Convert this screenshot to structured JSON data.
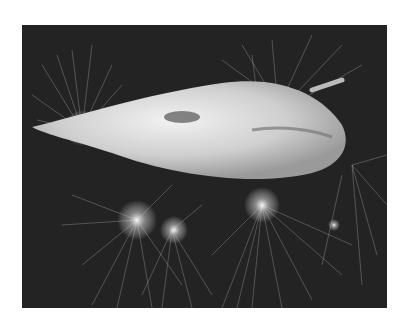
{
  "image": {
    "subject": "milkweed seed pod with silky seed fibers",
    "style": "black and white photograph",
    "background_color": "#232323",
    "page_background": "#ffffff"
  }
}
